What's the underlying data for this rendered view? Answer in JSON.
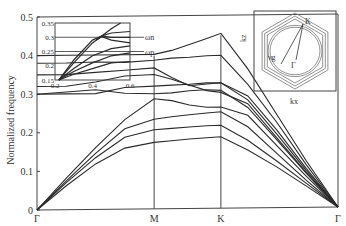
{
  "chart_data": {
    "type": "line",
    "title": "",
    "xlabel": "",
    "ylabel": "Normalized frequency",
    "ylim": [
      0,
      0.5
    ],
    "yticks": [
      "0",
      "0.1",
      "0.2",
      "0.3",
      "0.4",
      "0.5"
    ],
    "x_symmetry_points": [
      {
        "label": "Γ",
        "k": 0
      },
      {
        "label": "M",
        "k": 1
      },
      {
        "label": "K",
        "k": 1.57
      },
      {
        "label": "Γ",
        "k": 2.57
      }
    ],
    "k": [
      0,
      0.25,
      0.5,
      0.75,
      1.0,
      1.15,
      1.3,
      1.45,
      1.57,
      1.8,
      2.05,
      2.3,
      2.57
    ],
    "series": [
      {
        "name": "band-1",
        "values": [
          0,
          0.062,
          0.118,
          0.158,
          0.172,
          0.176,
          0.18,
          0.183,
          0.185,
          0.15,
          0.105,
          0.055,
          0
        ]
      },
      {
        "name": "band-2",
        "values": [
          0,
          0.07,
          0.134,
          0.186,
          0.205,
          0.208,
          0.211,
          0.214,
          0.215,
          0.175,
          0.12,
          0.062,
          0
        ]
      },
      {
        "name": "band-3",
        "values": [
          0,
          0.075,
          0.145,
          0.208,
          0.232,
          0.238,
          0.243,
          0.247,
          0.25,
          0.21,
          0.14,
          0.07,
          0
        ]
      },
      {
        "name": "band-4",
        "values": [
          0,
          0.082,
          0.16,
          0.232,
          0.285,
          0.28,
          0.268,
          0.262,
          0.262,
          0.24,
          0.16,
          0.08,
          0
        ]
      },
      {
        "name": "band-5",
        "values": [
          0.3,
          0.305,
          0.31,
          0.3,
          0.298,
          0.3,
          0.305,
          0.307,
          0.305,
          0.26,
          0.175,
          0.088,
          0
        ]
      },
      {
        "name": "band-6",
        "values": [
          0.3,
          0.3,
          0.3,
          0.315,
          0.318,
          0.32,
          0.322,
          0.325,
          0.325,
          0.28,
          0.19,
          0.095,
          0
        ]
      },
      {
        "name": "band-7",
        "values": [
          0.32,
          0.32,
          0.33,
          0.345,
          0.348,
          0.335,
          0.32,
          0.305,
          0.3,
          0.27,
          0.18,
          0.09,
          0
        ]
      },
      {
        "name": "band-8",
        "values": [
          0.35,
          0.35,
          0.355,
          0.36,
          0.365,
          0.34,
          0.318,
          0.322,
          0.325,
          0.29,
          0.2,
          0.1,
          0
        ]
      },
      {
        "name": "band-9",
        "values": [
          0.38,
          0.38,
          0.382,
          0.38,
          0.385,
          0.39,
          0.392,
          0.395,
          0.396,
          0.32,
          0.22,
          0.11,
          0
        ]
      },
      {
        "name": "band-10",
        "values": [
          0.4,
          0.4,
          0.4,
          0.4,
          0.4,
          0.41,
          0.425,
          0.44,
          0.453,
          0.36,
          0.24,
          0.12,
          0
        ]
      }
    ],
    "inset": {
      "xlim": [
        0.2,
        0.6
      ],
      "ylim": [
        0.15,
        0.35
      ],
      "xticks": [
        "0.2",
        "0.4",
        "0.6"
      ],
      "yticks": [
        "0.15",
        "0.2",
        "0.25",
        "0.3",
        "0.35"
      ],
      "annotations": [
        {
          "label": "ωn",
          "value": 0.3
        },
        {
          "label": "ωp",
          "value": 0.25
        }
      ],
      "series": [
        {
          "name": "inset-1",
          "x": [
            0.22,
            0.3,
            0.4,
            0.5,
            0.6
          ],
          "y": [
            0.15,
            0.17,
            0.19,
            0.21,
            0.215
          ]
        },
        {
          "name": "inset-2",
          "x": [
            0.22,
            0.3,
            0.4,
            0.5,
            0.6
          ],
          "y": [
            0.15,
            0.18,
            0.21,
            0.235,
            0.245
          ]
        },
        {
          "name": "inset-3",
          "x": [
            0.22,
            0.3,
            0.4,
            0.5,
            0.6
          ],
          "y": [
            0.15,
            0.19,
            0.235,
            0.26,
            0.27
          ]
        },
        {
          "name": "inset-4",
          "x": [
            0.22,
            0.3,
            0.4,
            0.45,
            0.5,
            0.6
          ],
          "y": [
            0.15,
            0.22,
            0.29,
            0.305,
            0.315,
            0.32
          ]
        },
        {
          "name": "inset-5",
          "x": [
            0.42,
            0.45,
            0.5,
            0.6
          ],
          "y": [
            0.29,
            0.305,
            0.3,
            0.3
          ]
        },
        {
          "name": "inset-6",
          "x": [
            0.42,
            0.45,
            0.5,
            0.6
          ],
          "y": [
            0.29,
            0.302,
            0.29,
            0.28
          ]
        },
        {
          "name": "inset-7",
          "x": [
            0.22,
            0.3,
            0.4,
            0.5,
            0.55
          ],
          "y": [
            0.15,
            0.21,
            0.28,
            0.33,
            0.35
          ]
        }
      ]
    },
    "inset2": {
      "xlabel": "kx",
      "ylabel": "kz",
      "labels": [
        "K",
        "Γ",
        "νg"
      ]
    }
  }
}
